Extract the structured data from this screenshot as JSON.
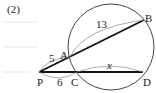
{
  "problem_number": "(2)",
  "diagram": {
    "points": {
      "P": "P",
      "A": "A",
      "B": "B",
      "C": "C",
      "D": "D"
    },
    "segments": {
      "PA": "5",
      "AB": "13",
      "PC": "6",
      "CD": "x"
    }
  }
}
